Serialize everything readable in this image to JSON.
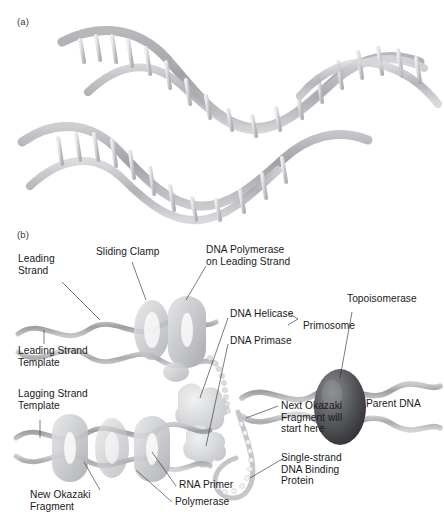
{
  "figure": {
    "panels": [
      {
        "mark": "(a)",
        "caption": ""
      },
      {
        "mark": "(b)",
        "caption": ""
      }
    ]
  },
  "panel_a": {
    "mark": "(a)",
    "description": "DNA double helix unwinding into two separated strands with paired bases on rungs",
    "bases": [
      "A",
      "T",
      "G",
      "C"
    ],
    "upper_strand_bases": [
      "G",
      "T",
      "C",
      "A",
      "G",
      "C",
      "C",
      "A",
      "T",
      "G",
      "C",
      "A",
      "G",
      "T",
      "C",
      "A",
      "G",
      "C",
      "T",
      "A",
      "G",
      "C",
      "C",
      "G"
    ],
    "lower_strand_bases": [
      "G",
      "C",
      "A",
      "T",
      "A",
      "C",
      "G",
      "C",
      "T",
      "A",
      "G",
      "A",
      "C",
      "T",
      "G",
      "C"
    ]
  },
  "panel_b": {
    "mark": "(b)",
    "description": "Replication fork showing leading and lagging strand synthesis machinery",
    "labels": [
      {
        "id": "leading-strand",
        "text": "Leading\nStrand"
      },
      {
        "id": "sliding-clamp",
        "text": "Sliding Clamp"
      },
      {
        "id": "dna-polymerase-leading",
        "text": "DNA Polymerase\non Leading Strand"
      },
      {
        "id": "leading-strand-template",
        "text": "Leading Strand\nTemplate"
      },
      {
        "id": "lagging-strand-template",
        "text": "Lagging Strand\nTemplate"
      },
      {
        "id": "dna-helicase",
        "text": "DNA Helicase"
      },
      {
        "id": "dna-primase",
        "text": "DNA Primase"
      },
      {
        "id": "primosome",
        "text": "Primosome"
      },
      {
        "id": "topoisomerase",
        "text": "Topoisomerase"
      },
      {
        "id": "parent-dna",
        "text": "Parent DNA"
      },
      {
        "id": "next-okazaki",
        "text": "Next Okazaki\nFragment will\nstart here"
      },
      {
        "id": "ssb-protein",
        "text": "Single-strand\nDNA Binding\nProtein"
      },
      {
        "id": "rna-primer",
        "text": "RNA Primer"
      },
      {
        "id": "polymerase",
        "text": "Polymerase"
      },
      {
        "id": "new-okazaki",
        "text": "New Okazaki\nFragment"
      }
    ]
  },
  "colors": {
    "background": "#ffffff",
    "text": "#1a1a1a",
    "leader_line": "#2b2b2b",
    "helix_dark": "#8e9094",
    "helix_mid": "#b4b6ba",
    "helix_light": "#d8dadd",
    "protein_light": "#d2d4d7",
    "protein_mid": "#b9bbbe",
    "topoisomerase_dark": "#4a4c50"
  }
}
